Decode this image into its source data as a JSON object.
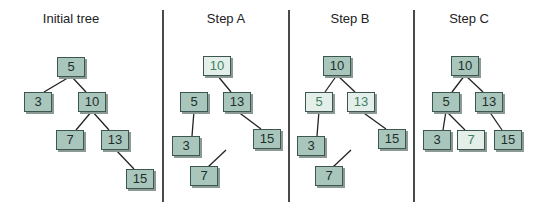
{
  "diagram": {
    "colors": {
      "node_dark": "#a9c6bd",
      "node_light": "#e4efea",
      "edge": "#222222",
      "divider": "#4a4a4a"
    },
    "panels": [
      {
        "title": "Initial tree",
        "title_x": 71,
        "nodes": [
          {
            "id": "n5",
            "label": "5",
            "x": 71,
            "y": 67,
            "style": "dark"
          },
          {
            "id": "n3",
            "label": "3",
            "x": 38,
            "y": 102,
            "style": "dark"
          },
          {
            "id": "n10",
            "label": "10",
            "x": 92,
            "y": 102,
            "style": "dark"
          },
          {
            "id": "n7",
            "label": "7",
            "x": 70,
            "y": 140,
            "style": "dark"
          },
          {
            "id": "n13",
            "label": "13",
            "x": 115,
            "y": 140,
            "style": "dark"
          },
          {
            "id": "n15",
            "label": "15",
            "x": 140,
            "y": 179,
            "style": "dark"
          }
        ],
        "edges": [
          {
            "from": "n5",
            "to": "n3"
          },
          {
            "from": "n5",
            "to": "n10"
          },
          {
            "from": "n10",
            "to": "n7"
          },
          {
            "from": "n10",
            "to": "n13"
          },
          {
            "from": "n13",
            "to": "n15"
          }
        ],
        "dangling": []
      },
      {
        "title": "Step A",
        "title_x": 226,
        "nodes": [
          {
            "id": "n10",
            "label": "10",
            "x": 217,
            "y": 66,
            "style": "light"
          },
          {
            "id": "n5",
            "label": "5",
            "x": 194,
            "y": 102,
            "style": "dark"
          },
          {
            "id": "n13",
            "label": "13",
            "x": 237,
            "y": 102,
            "style": "dark"
          },
          {
            "id": "n3",
            "label": "3",
            "x": 186,
            "y": 146,
            "style": "dark"
          },
          {
            "id": "n15",
            "label": "15",
            "x": 267,
            "y": 139,
            "style": "dark"
          },
          {
            "id": "n7",
            "label": "7",
            "x": 204,
            "y": 176,
            "style": "dark"
          }
        ],
        "edges": [
          {
            "from": "n10",
            "to": "n13"
          },
          {
            "from": "n5",
            "to": "n3"
          },
          {
            "from": "n13",
            "to": "n15"
          }
        ],
        "dangling": [
          {
            "x1": 226,
            "y1": 150,
            "x2": 208,
            "y2": 167
          }
        ]
      },
      {
        "title": "Step B",
        "title_x": 350,
        "nodes": [
          {
            "id": "n10",
            "label": "10",
            "x": 337,
            "y": 66,
            "style": "dark"
          },
          {
            "id": "n5",
            "label": "5",
            "x": 319,
            "y": 102,
            "style": "light"
          },
          {
            "id": "n13",
            "label": "13",
            "x": 361,
            "y": 102,
            "style": "light"
          },
          {
            "id": "n3",
            "label": "3",
            "x": 311,
            "y": 146,
            "style": "dark"
          },
          {
            "id": "n15",
            "label": "15",
            "x": 392,
            "y": 139,
            "style": "dark"
          },
          {
            "id": "n7",
            "label": "7",
            "x": 329,
            "y": 176,
            "style": "dark"
          }
        ],
        "edges": [
          {
            "from": "n10",
            "to": "n5"
          },
          {
            "from": "n10",
            "to": "n13"
          },
          {
            "from": "n5",
            "to": "n3"
          },
          {
            "from": "n13",
            "to": "n15"
          }
        ],
        "dangling": [
          {
            "x1": 351,
            "y1": 150,
            "x2": 333,
            "y2": 167
          }
        ]
      },
      {
        "title": "Step C",
        "title_x": 469,
        "nodes": [
          {
            "id": "n10",
            "label": "10",
            "x": 465,
            "y": 66,
            "style": "dark"
          },
          {
            "id": "n5",
            "label": "5",
            "x": 446,
            "y": 102,
            "style": "dark"
          },
          {
            "id": "n13",
            "label": "13",
            "x": 489,
            "y": 102,
            "style": "dark"
          },
          {
            "id": "n3",
            "label": "3",
            "x": 437,
            "y": 140,
            "style": "dark"
          },
          {
            "id": "n7",
            "label": "7",
            "x": 471,
            "y": 140,
            "style": "light"
          },
          {
            "id": "n15",
            "label": "15",
            "x": 508,
            "y": 140,
            "style": "dark"
          }
        ],
        "edges": [
          {
            "from": "n10",
            "to": "n5"
          },
          {
            "from": "n10",
            "to": "n13"
          },
          {
            "from": "n5",
            "to": "n3"
          },
          {
            "from": "n5",
            "to": "n7"
          },
          {
            "from": "n13",
            "to": "n15"
          }
        ],
        "dangling": []
      }
    ],
    "dividers": [
      163,
      289,
      414
    ]
  }
}
